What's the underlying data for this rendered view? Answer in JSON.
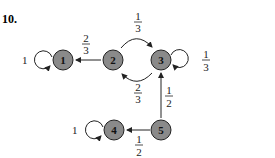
{
  "problem_number": "10.",
  "colors": {
    "node_fill": "#8a8a8a",
    "stroke": "#222222",
    "background": "#ffffff"
  },
  "nodes": [
    {
      "id": "1",
      "label": "1"
    },
    {
      "id": "2",
      "label": "2"
    },
    {
      "id": "3",
      "label": "3"
    },
    {
      "id": "4",
      "label": "4"
    },
    {
      "id": "5",
      "label": "5"
    }
  ],
  "edges": [
    {
      "from": "1",
      "to": "1",
      "num": "1",
      "den": "",
      "label": "1"
    },
    {
      "from": "2",
      "to": "1",
      "num": "2",
      "den": "3"
    },
    {
      "from": "2",
      "to": "3",
      "num": "1",
      "den": "3"
    },
    {
      "from": "3",
      "to": "2",
      "num": "2",
      "den": "3"
    },
    {
      "from": "3",
      "to": "3",
      "num": "1",
      "den": "3"
    },
    {
      "from": "5",
      "to": "3",
      "num": "1",
      "den": "2"
    },
    {
      "from": "5",
      "to": "4",
      "num": "1",
      "den": "2"
    },
    {
      "from": "4",
      "to": "4",
      "num": "1",
      "den": "",
      "label": "1"
    }
  ]
}
